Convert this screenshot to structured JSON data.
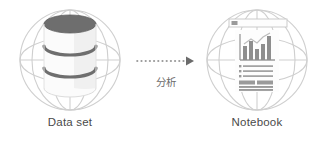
{
  "diagram": {
    "type": "flow",
    "background_color": "#ffffff",
    "nodes": [
      {
        "id": "dataset",
        "label": "Data set",
        "icon": "globe-database-icon",
        "icon_description": "Database cylinder inside a wireframe globe",
        "globe_color": "#cfcfcf",
        "icon_color": "#6e6e6e"
      },
      {
        "id": "notebook",
        "label": "Notebook",
        "icon": "globe-notebook-icon",
        "icon_description": "Document page with bar chart, bullet list and text blocks inside a wireframe globe",
        "globe_color": "#cfcfcf",
        "icon_color": "#9a9a9a"
      }
    ],
    "connector": {
      "label": "分析",
      "style": "dotted-arrow",
      "direction": "left-to-right",
      "color": "#7d7d7d",
      "label_color": "#6b6b6b"
    }
  },
  "colors": {
    "background": "#ffffff",
    "label_text": "#4a4a4a",
    "globe_line": "#cfcfcf",
    "database_dark": "#6e6e6e",
    "database_light": "#f2f2f2",
    "notebook_gray": "#9a9a9a",
    "arrow": "#7d7d7d"
  }
}
